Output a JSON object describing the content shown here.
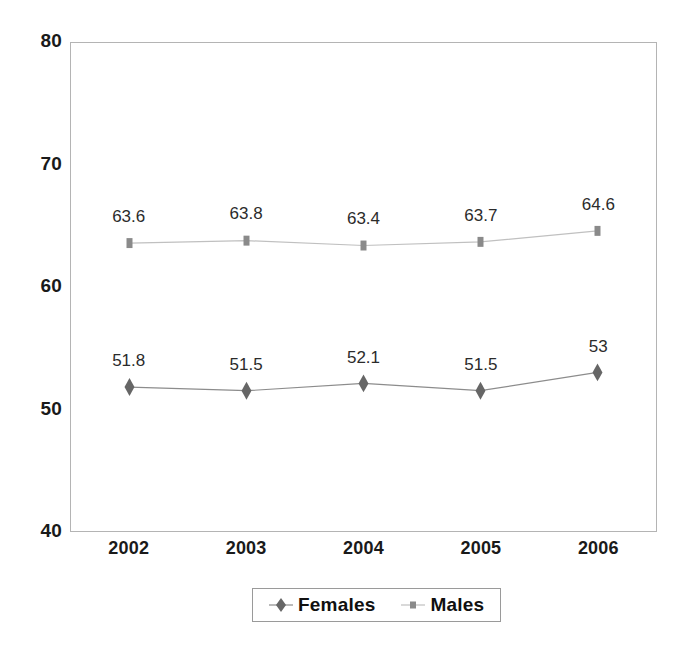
{
  "chart_data": {
    "type": "line",
    "title": "",
    "subtitle": "",
    "xlabel": "",
    "ylabel": "",
    "categories": [
      "2002",
      "2003",
      "2004",
      "2005",
      "2006"
    ],
    "series": [
      {
        "name": "Females",
        "marker": "diamond",
        "color": "#666666",
        "line_color": "#8c8c8c",
        "values": [
          51.8,
          51.5,
          52.1,
          51.5,
          53
        ],
        "labels": [
          "51.8",
          "51.5",
          "52.1",
          "51.5",
          "53"
        ]
      },
      {
        "name": "Males",
        "marker": "square",
        "color": "#8a8a8a",
        "line_color": "#c0c0c0",
        "values": [
          63.6,
          63.8,
          63.4,
          63.7,
          64.6
        ],
        "labels": [
          "63.6",
          "63.8",
          "63.4",
          "63.7",
          "64.6"
        ]
      }
    ],
    "ylim": [
      40,
      80
    ],
    "yticks": [
      40,
      50,
      60,
      70,
      80
    ],
    "ytick_labels": [
      "40",
      "50",
      "60",
      "70",
      "80"
    ],
    "grid": false,
    "legend_position": "bottom",
    "data_labels": true
  },
  "legend": {
    "entries": [
      {
        "label": "Females",
        "marker": "diamond-marker-icon"
      },
      {
        "label": "Males",
        "marker": "square-marker-icon"
      }
    ]
  },
  "axes": {
    "y_axis_name": "y-axis",
    "x_axis_name": "x-axis"
  },
  "colors": {
    "plot_border": "#b4b4b4",
    "axis_text": "#1a1a1a",
    "data_label_text": "#2b2b2b",
    "females_marker": "#666666",
    "females_line": "#8c8c8c",
    "males_marker": "#8a8a8a",
    "males_line": "#c0c0c0",
    "legend_border": "#9a9a9a",
    "background": "#ffffff"
  }
}
